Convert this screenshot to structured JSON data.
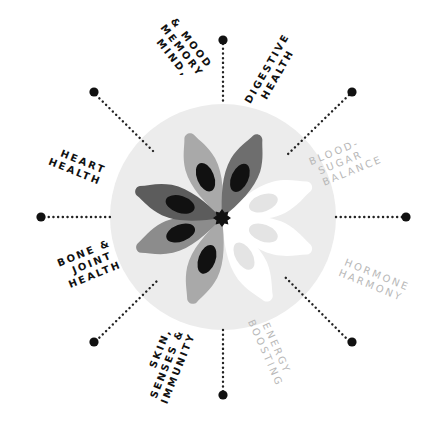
{
  "diagram": {
    "type": "radial-wheel",
    "center": {
      "x": 223,
      "y": 217
    },
    "circle": {
      "radius": 113,
      "color": "#ececec"
    },
    "spokes": [
      {
        "id": "digestive",
        "angle": -90,
        "active": true
      },
      {
        "id": "blood-sugar",
        "angle": -45,
        "active": true
      },
      {
        "id": "hormone",
        "angle": 0,
        "active": true
      },
      {
        "id": "energy",
        "angle": 45,
        "active": true
      },
      {
        "id": "skin",
        "angle": 90,
        "active": true
      },
      {
        "id": "bone",
        "angle": 135,
        "active": true
      },
      {
        "id": "heart",
        "angle": 180,
        "active": true
      },
      {
        "id": "mind",
        "angle": -135,
        "active": true
      }
    ],
    "labels": {
      "mind": [
        "MIND,",
        "MEMORY",
        "& MOOD"
      ],
      "digestive": [
        "DIGESTIVE",
        "HEALTH"
      ],
      "blood_sugar": [
        "BLOOD-",
        "SUGAR",
        "BALANCE"
      ],
      "heart": [
        "HEART",
        "HEALTH"
      ],
      "hormone": [
        "HORMONE",
        "HARMONY"
      ],
      "bone": [
        "BONE &",
        "JOINT",
        "HEALTH"
      ],
      "skin": [
        "SKIN,",
        "SENSES &",
        "IMMUNITY"
      ],
      "energy": [
        "ENERGY",
        "BOOSTING"
      ]
    },
    "colors": {
      "dark_text": "#111111",
      "faded_text": "#b8b8b8",
      "dot": "#111111",
      "petal_dark": "#5c5c5c",
      "petal_mid": "#8c8c8c",
      "petal_light": "#a9a9a9",
      "petal_white": "#ffffff",
      "petal_ghost": "#e2e2e2"
    }
  }
}
